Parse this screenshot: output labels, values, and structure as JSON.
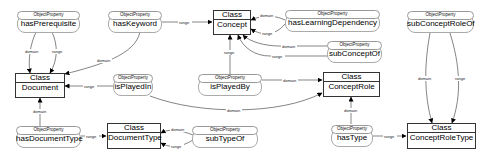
{
  "diagram": {
    "classes": [
      {
        "id": "concept",
        "header": "Class",
        "name": "Concept"
      },
      {
        "id": "document",
        "header": "Class",
        "name": "Document"
      },
      {
        "id": "concept-role",
        "header": "Class",
        "name": "ConceptRole"
      },
      {
        "id": "document-type",
        "header": "Class",
        "name": "DocumentType"
      },
      {
        "id": "concept-role-type",
        "header": "Class",
        "name": "ConceptRoleType"
      }
    ],
    "object_properties": [
      {
        "id": "has-prerequisite",
        "tag": "ObjectProperty",
        "name": "hasPrerequisite"
      },
      {
        "id": "has-keyword",
        "tag": "ObjectProperty",
        "name": "hasKeyword"
      },
      {
        "id": "has-learning-dependency",
        "tag": "ObjectProperty",
        "name": "hasLearningDependency"
      },
      {
        "id": "sub-concept-of",
        "tag": "ObjectProperty",
        "name": "subConceptOf"
      },
      {
        "id": "sub-concept-role-of",
        "tag": "ObjectProperty",
        "name": "subConceptRoleOf"
      },
      {
        "id": "is-played-in",
        "tag": "ObjectProperty",
        "name": "isPlayedIn"
      },
      {
        "id": "is-played-by",
        "tag": "ObjectProperty",
        "name": "isPlayedBy"
      },
      {
        "id": "has-document-type",
        "tag": "ObjectProperty",
        "name": "hasDocumentType"
      },
      {
        "id": "sub-type-of",
        "tag": "ObjectProperty",
        "name": "subTypeOf"
      },
      {
        "id": "has-type",
        "tag": "ObjectProperty",
        "name": "hasType"
      }
    ],
    "edge_labels": {
      "domain": "domain",
      "range": "range"
    },
    "edges": [
      {
        "from": "hasPrerequisite",
        "to": "Document",
        "label": "domain"
      },
      {
        "from": "hasPrerequisite",
        "to": "Document",
        "label": "range"
      },
      {
        "from": "hasKeyword",
        "to": "Document",
        "label": "domain"
      },
      {
        "from": "hasKeyword",
        "to": "Concept",
        "label": "range"
      },
      {
        "from": "hasLearningDependency",
        "to": "Concept",
        "label": "domain"
      },
      {
        "from": "hasLearningDependency",
        "to": "Concept",
        "label": "range"
      },
      {
        "from": "subConceptOf",
        "to": "Concept",
        "label": "domain"
      },
      {
        "from": "subConceptOf",
        "to": "Concept",
        "label": "range"
      },
      {
        "from": "isPlayedBy",
        "to": "Concept",
        "label": "range"
      },
      {
        "from": "isPlayedBy",
        "to": "ConceptRole",
        "label": "domain"
      },
      {
        "from": "isPlayedIn",
        "to": "Document",
        "label": "range"
      },
      {
        "from": "isPlayedIn",
        "to": "ConceptRole",
        "label": "domain"
      },
      {
        "from": "hasDocumentType",
        "to": "Document",
        "label": "domain"
      },
      {
        "from": "hasDocumentType",
        "to": "DocumentType",
        "label": "range"
      },
      {
        "from": "subTypeOf",
        "to": "DocumentType",
        "label": "domain"
      },
      {
        "from": "subTypeOf",
        "to": "DocumentType",
        "label": "range"
      },
      {
        "from": "hasType",
        "to": "ConceptRole",
        "label": "domain"
      },
      {
        "from": "hasType",
        "to": "ConceptRoleType",
        "label": "range"
      },
      {
        "from": "subConceptRoleOf",
        "to": "ConceptRoleType",
        "label": "domain"
      },
      {
        "from": "subConceptRoleOf",
        "to": "ConceptRoleType",
        "label": "range"
      }
    ]
  }
}
